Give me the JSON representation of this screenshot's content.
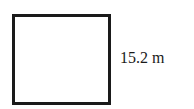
{
  "diagram": {
    "shape": "square",
    "side_label": "15.2 m",
    "colors": {
      "stroke": "#1a1a1a",
      "fill": "#ffffff",
      "text": "#1a1a1a"
    }
  }
}
